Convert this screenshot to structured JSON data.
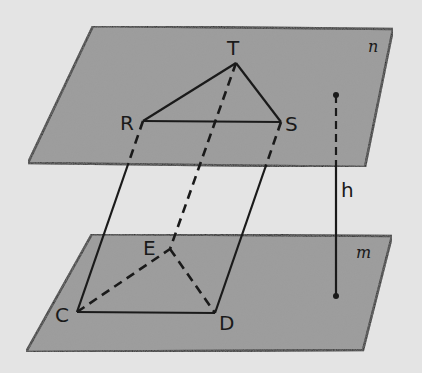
{
  "diagram": {
    "type": "prism-between-parallel-planes",
    "background_color": "#e4e4e4",
    "plane_color": "#9c9c9c",
    "line_color": "#1a1a1a",
    "planes": [
      {
        "name": "n",
        "label": "n",
        "points": [
          [
            93,
            26
          ],
          [
            393,
            29
          ],
          [
            365,
            167
          ],
          [
            28,
            163
          ]
        ],
        "label_pos": [
          368,
          52
        ]
      },
      {
        "name": "m",
        "label": "m",
        "points": [
          [
            92,
            234
          ],
          [
            392,
            236
          ],
          [
            363,
            350
          ],
          [
            26,
            352
          ]
        ],
        "label_pos": [
          356,
          258
        ]
      }
    ],
    "vertices": {
      "T": {
        "label": "T",
        "x": 236,
        "y": 63,
        "label_pos": [
          227,
          55
        ]
      },
      "R": {
        "label": "R",
        "x": 143,
        "y": 121,
        "label_pos": [
          120,
          130
        ]
      },
      "S": {
        "label": "S",
        "x": 281,
        "y": 122,
        "label_pos": [
          285,
          131
        ]
      },
      "E": {
        "label": "E",
        "x": 170,
        "y": 249,
        "label_pos": [
          143,
          255
        ]
      },
      "C": {
        "label": "C",
        "x": 77,
        "y": 312,
        "label_pos": [
          55,
          322
        ]
      },
      "D": {
        "label": "D",
        "x": 215,
        "y": 313,
        "label_pos": [
          219,
          330
        ]
      }
    },
    "edges_solid": [
      [
        "R",
        "T"
      ],
      [
        "T",
        "S"
      ],
      [
        "R",
        "S"
      ],
      [
        "C",
        "D"
      ]
    ],
    "edges_dashed": [
      [
        "C",
        "E"
      ],
      [
        "E",
        "D"
      ]
    ],
    "lateral_edges": [
      {
        "from": "R",
        "to": "C",
        "dashed_part_until_y": 163
      },
      {
        "from": "S",
        "to": "D",
        "dashed_part_until_y": 167
      },
      {
        "from": "T",
        "to": "E",
        "dashed_full": true
      }
    ],
    "height_segment": {
      "label": "h",
      "x": 336,
      "y_top": 95,
      "y_bottom": 296,
      "dashed_until_y": 165,
      "label_pos": [
        341,
        197
      ]
    }
  }
}
